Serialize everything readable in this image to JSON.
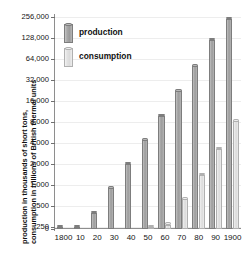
{
  "chart_data": {
    "type": "bar",
    "title": "",
    "xlabel": "",
    "ylabel": "production in thousands of short tons, consumption in trillions of British thermal units",
    "ylabel_lines": [
      "production in thousands of short tons,",
      "consumption in trillions of British thermal units"
    ],
    "scale": "log2",
    "ylim": [
      125,
      256000
    ],
    "ytick_labels": [
      "256,000",
      "128,000",
      "64,000",
      "32,000",
      "16,000",
      "8,000",
      "4,000",
      "2,000",
      "1,000",
      "500",
      "250",
      "0"
    ],
    "ytick_values": [
      256000,
      128000,
      64000,
      32000,
      16000,
      8000,
      4000,
      2000,
      1000,
      500,
      250,
      0
    ],
    "grid": true,
    "legend_position": "top-left",
    "categories": [
      "1800",
      "10",
      "20",
      "30",
      "40",
      "50",
      "60",
      "70",
      "80",
      "90",
      "1900"
    ],
    "series": [
      {
        "name": "production",
        "color": "#a3a3a3",
        "values": [
          120,
          180,
          400,
          900,
          2000,
          4400,
          9800,
          22000,
          50000,
          120000,
          240000
        ]
      },
      {
        "name": "consumption",
        "color": "#e4e4e4",
        "values": [
          null,
          null,
          null,
          null,
          null,
          170,
          270,
          620,
          1400,
          3300,
          8200
        ]
      }
    ],
    "legend": [
      {
        "key": "production",
        "label": "production"
      },
      {
        "key": "consumption",
        "label": "consumption"
      }
    ]
  }
}
